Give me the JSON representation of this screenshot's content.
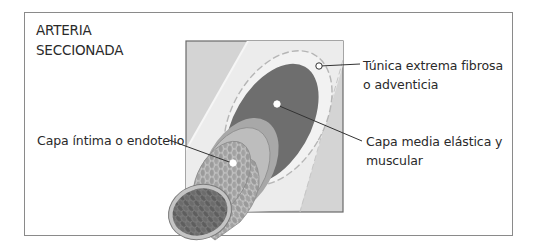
{
  "diagram": {
    "title_lines": [
      "ARTERIA",
      "SECCIONADA"
    ],
    "labels": {
      "adventicia": [
        "Túnica extrema fibrosa",
        "o adventicia"
      ],
      "media": [
        "Capa media elástica y",
        "muscular"
      ],
      "intima": [
        "Capa íntima o endotelio"
      ]
    },
    "colors": {
      "frame_border": "#8a8a8a",
      "background_square": "#d4d4d4",
      "adventicia": "#ededed",
      "media": "#6e6e6e",
      "elastic_ring": "#a9a9a9",
      "intima": "#9a9a9a",
      "lumen": "#6a6a6a",
      "leader_line": "#333333"
    }
  }
}
